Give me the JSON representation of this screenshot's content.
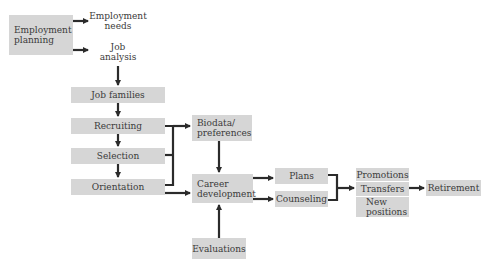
{
  "diagram": {
    "colors": {
      "box_fill": "#d6d6d6",
      "line": "#2b2b2b",
      "text": "#3a3a3a"
    },
    "nodes": {
      "employment_planning": "Employment planning",
      "employment_needs": "Employment needs",
      "job_analysis": "Job analysis",
      "job_families": "Job families",
      "recruiting": "Recruiting",
      "selection": "Selection",
      "orientation": "Orientation",
      "biodata": "Biodata/ preferences",
      "career_development": "Career development",
      "evaluations": "Evaluations",
      "plans": "Plans",
      "counseling": "Counseling",
      "promotions": "Promotions",
      "transfers": "Transfers",
      "new_positions": "New positions",
      "retirement": "Retirement"
    },
    "edges": [
      [
        "Employment planning",
        "Employment needs"
      ],
      [
        "Employment planning",
        "Job analysis"
      ],
      [
        "Job analysis",
        "Job families"
      ],
      [
        "Job families",
        "Recruiting"
      ],
      [
        "Recruiting",
        "Selection"
      ],
      [
        "Selection",
        "Orientation"
      ],
      [
        "Recruiting/Selection/Orientation",
        "Biodata/ preferences"
      ],
      [
        "Orientation",
        "Career development"
      ],
      [
        "Biodata/ preferences",
        "Career development"
      ],
      [
        "Evaluations",
        "Career development"
      ],
      [
        "Career development",
        "Plans"
      ],
      [
        "Career development",
        "Counseling"
      ],
      [
        "Plans/Counseling",
        "Transfers"
      ],
      [
        "Transfers",
        "Retirement"
      ]
    ]
  }
}
